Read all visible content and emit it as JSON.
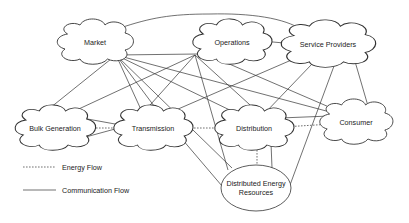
{
  "diagram": {
    "nodes": [
      {
        "id": "market",
        "label": "Market",
        "shape": "cloud",
        "cx": 95,
        "cy": 42
      },
      {
        "id": "operations",
        "label": "Operations",
        "shape": "cloud",
        "cx": 232,
        "cy": 42
      },
      {
        "id": "service_providers",
        "label": "Service Providers",
        "shape": "cloud",
        "cx": 328,
        "cy": 44
      },
      {
        "id": "bulk_generation",
        "label": "Bulk Generation",
        "shape": "cloud",
        "cx": 55,
        "cy": 128
      },
      {
        "id": "transmission",
        "label": "Transmission",
        "shape": "cloud",
        "cx": 153,
        "cy": 128
      },
      {
        "id": "distribution",
        "label": "Distribution",
        "shape": "cloud",
        "cx": 254,
        "cy": 128
      },
      {
        "id": "consumer",
        "label": "Consumer",
        "shape": "cloud",
        "cx": 356,
        "cy": 122
      },
      {
        "id": "der",
        "label_line1": "Distributed Energy",
        "label_line2": "Resources",
        "shape": "ellipse",
        "cx": 256,
        "cy": 188
      }
    ],
    "legend": {
      "energy_flow": "Energy Flow",
      "communication_flow": "Communication Flow"
    },
    "edges": {
      "communication": [
        [
          "market",
          "operations"
        ],
        [
          "market",
          "service_providers"
        ],
        [
          "market",
          "bulk_generation"
        ],
        [
          "market",
          "transmission"
        ],
        [
          "market",
          "distribution"
        ],
        [
          "market",
          "consumer"
        ],
        [
          "market",
          "der"
        ],
        [
          "operations",
          "service_providers"
        ],
        [
          "operations",
          "bulk_generation"
        ],
        [
          "operations",
          "transmission"
        ],
        [
          "operations",
          "distribution"
        ],
        [
          "operations",
          "consumer"
        ],
        [
          "operations",
          "der"
        ],
        [
          "service_providers",
          "transmission"
        ],
        [
          "service_providers",
          "distribution"
        ],
        [
          "service_providers",
          "consumer"
        ],
        [
          "service_providers",
          "der"
        ],
        [
          "bulk_generation",
          "transmission"
        ],
        [
          "transmission",
          "der"
        ],
        [
          "distribution",
          "der"
        ]
      ],
      "energy": [
        [
          "bulk_generation",
          "transmission"
        ],
        [
          "transmission",
          "distribution"
        ],
        [
          "distribution",
          "consumer"
        ],
        [
          "distribution",
          "der"
        ]
      ]
    },
    "colors": {
      "stroke": "#333333",
      "background": "#ffffff",
      "text": "#222222"
    }
  }
}
